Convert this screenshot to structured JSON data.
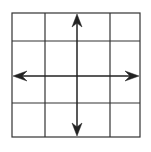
{
  "diagram": {
    "type": "grid-with-arrows",
    "rows": 4,
    "columns": 4,
    "grid_color": "#333333",
    "arrow_color": "#222222",
    "background": "#ffffff",
    "grid": {
      "x_lines": [
        12,
        45,
        77,
        110,
        140
      ],
      "y_lines": [
        13,
        41,
        76,
        103,
        137
      ]
    },
    "arrows": [
      {
        "name": "vertical",
        "direction": "up-down",
        "x": 77,
        "y1": 14,
        "y2": 136
      },
      {
        "name": "horizontal",
        "direction": "left-right",
        "y": 76,
        "x1": 13,
        "x2": 139
      }
    ]
  }
}
